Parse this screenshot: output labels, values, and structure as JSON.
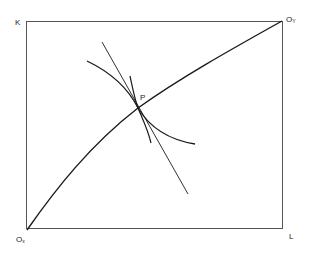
{
  "diagram": {
    "type": "edgeworth-box",
    "labels": {
      "k_axis": "K",
      "l_axis": "L",
      "origin_x": "O",
      "origin_x_sub": "x",
      "origin_y": "O",
      "origin_y_sub": "Y",
      "point": "P"
    },
    "box": {
      "x1": 26,
      "y1": 22,
      "x2": 283,
      "y2": 229
    },
    "colors": {
      "line": "#1a1a1a",
      "box": "#555555",
      "background": "#ffffff"
    },
    "elements": [
      "contract curve from Ox to Oy",
      "tangent line through P",
      "convex isoquant through P",
      "second isoquant through P"
    ]
  }
}
